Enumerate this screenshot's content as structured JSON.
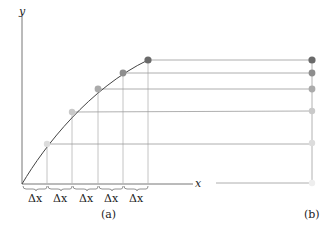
{
  "figure": {
    "axis_x_label": "x",
    "axis_y_label": "y",
    "step_label": "Δx",
    "step_count": 5,
    "panel_a_label": "(a)",
    "panel_b_label": "(b)"
  },
  "colors": {
    "axis": "#666666",
    "curve": "#444444",
    "gridline": "#aaaaaa",
    "points": [
      "#dcdcdc",
      "#c8c8c8",
      "#a9a9a9",
      "#8c8c8c",
      "#6a6a6a"
    ],
    "baseline_point": "#eeeeee"
  },
  "points_a": [
    {
      "x": 46,
      "y": 144
    },
    {
      "x": 73,
      "y": 112
    },
    {
      "x": 98,
      "y": 89
    },
    {
      "x": 123,
      "y": 73
    },
    {
      "x": 148,
      "y": 60
    }
  ]
}
